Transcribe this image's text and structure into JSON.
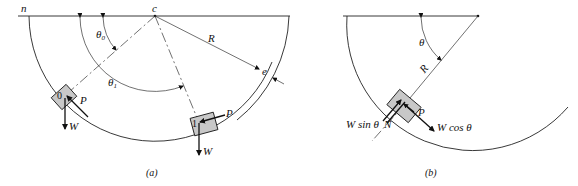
{
  "figure_a": {
    "caption": "(a)",
    "labels": {
      "left_end": "n",
      "center": "c",
      "theta0": "θ",
      "theta0_sub": "0",
      "theta1": "θ",
      "theta1_sub": "1",
      "radius": "R",
      "thickness": "e",
      "block0": "0",
      "block1": "1",
      "force_p0": "P",
      "weight0": "W",
      "force_p1": "P",
      "weight1": "W"
    }
  },
  "figure_b": {
    "caption": "(b)",
    "labels": {
      "theta": "θ",
      "radius": "R",
      "force_p": "P",
      "normal": "N",
      "w_sin": "W sin θ",
      "w_cos": "W cos θ"
    }
  }
}
